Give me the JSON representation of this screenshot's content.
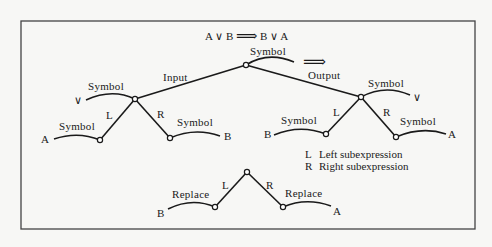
{
  "diagram": {
    "title_formula": {
      "lhs": "A ∨ B",
      "arrow": "⟹",
      "rhs": "B ∨ A"
    },
    "labels": {
      "input": "Input",
      "output": "Output",
      "transform_arrow": "⟹"
    },
    "top_node": {
      "symbol_label": "Symbol"
    },
    "input_tree": {
      "root": {
        "symbol_label": "Symbol",
        "value": "∨"
      },
      "left_edge": "L",
      "right_edge": "R",
      "left_child": {
        "symbol_label": "Symbol",
        "value": "A"
      },
      "right_child": {
        "symbol_label": "Symbol",
        "value": "B"
      }
    },
    "output_tree": {
      "root": {
        "symbol_label": "Symbol",
        "value": "∨"
      },
      "left_edge": "L",
      "right_edge": "R",
      "left_child": {
        "symbol_label": "Symbol",
        "value": "B"
      },
      "right_child": {
        "symbol_label": "Symbol",
        "value": "A"
      }
    },
    "legend": [
      {
        "key": "L",
        "text": "Left subexpression"
      },
      {
        "key": "R",
        "text": "Right subexpression"
      }
    ],
    "replace_tree": {
      "left_edge": "L",
      "right_edge": "R",
      "left_child": {
        "action_label": "Replace",
        "value": "B"
      },
      "right_child": {
        "action_label": "Replace",
        "value": "A"
      }
    }
  }
}
